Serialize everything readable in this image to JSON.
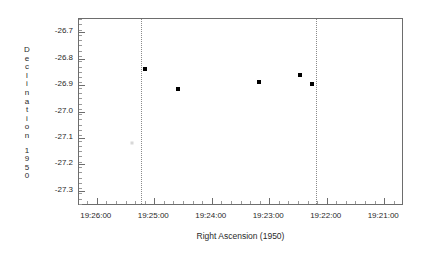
{
  "chart_data": {
    "type": "scatter",
    "title": "",
    "xlabel": "Right Ascension (1950)",
    "ylabel": "Declination 1950",
    "ylabel_chars": [
      "D",
      "e",
      "c",
      "l",
      "i",
      "n",
      "a",
      "t",
      "i",
      "o",
      "n",
      "",
      "1",
      "9",
      "5",
      "0"
    ],
    "xtick_labels": [
      "19:26:00",
      "19:25:00",
      "19:24:00",
      "19:23:00",
      "19:22:00",
      "19:21:00"
    ],
    "xtick_positions": [
      0,
      1,
      2,
      3,
      4,
      5
    ],
    "ytick_labels": [
      "-26.7",
      "-26.8",
      "-26.9",
      "-27.0",
      "-27.1",
      "-27.2",
      "-27.3"
    ],
    "ytick_values": [
      -26.7,
      -26.8,
      -26.9,
      -27.0,
      -27.1,
      -27.2,
      -27.3
    ],
    "xlim_labels": [
      "19:26:30",
      "19:20:40"
    ],
    "ylim": [
      -27.35,
      -26.65
    ],
    "grid": false,
    "legend": "none",
    "minor_ticks_per_major_y": 5,
    "minor_ticks_per_major_x": 6,
    "point_color": "#000000",
    "frame_color": "#6d6d6d",
    "guide_line_color": "#8a8a8a",
    "guide_lines": [
      {
        "name": "guide-19-25-10",
        "label": "19:25:10",
        "x_frac": 0.192
      },
      {
        "name": "guide-19-22-10",
        "label": "19:22:10",
        "x_frac": 0.735
      }
    ],
    "points": [
      {
        "name": "source-1",
        "x_frac": 0.203,
        "y_value": -26.838,
        "faint": false
      },
      {
        "name": "source-2",
        "x_frac": 0.308,
        "y_value": -26.916,
        "faint": false
      },
      {
        "name": "source-3",
        "x_frac": 0.557,
        "y_value": -26.89,
        "faint": false
      },
      {
        "name": "source-4",
        "x_frac": 0.683,
        "y_value": -26.862,
        "faint": false
      },
      {
        "name": "source-5",
        "x_frac": 0.72,
        "y_value": -26.896,
        "faint": false
      },
      {
        "name": "source-6",
        "x_frac": 0.163,
        "y_value": -27.118,
        "faint": true
      }
    ]
  }
}
